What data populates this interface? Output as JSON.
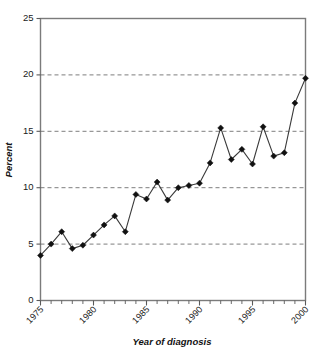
{
  "chart_data": {
    "type": "line",
    "title": "",
    "subtitle": "",
    "xlabel": "Year of diagnosis",
    "ylabel": "Percent",
    "xlim": [
      1975,
      2000
    ],
    "ylim": [
      0,
      25
    ],
    "xticks": [
      1975,
      1980,
      1985,
      1990,
      1995,
      2000
    ],
    "xtick_labels": [
      "1975",
      "1980",
      "1985",
      "1990",
      "1995",
      "2000"
    ],
    "x_minor_tick_interval": 1,
    "yticks": [
      0,
      5,
      10,
      15,
      20,
      25
    ],
    "ytick_labels": [
      "0",
      "5",
      "10",
      "15",
      "20",
      "25"
    ],
    "grid": "horizontal-dashed-at-5-10-15-20",
    "legend": "none",
    "marker": "diamond",
    "line_color": "#3a3a3a",
    "marker_color": "#111111",
    "frame_color": "#7b7b7b",
    "background_color": "#ffffff",
    "x": [
      1975,
      1976,
      1977,
      1978,
      1979,
      1980,
      1981,
      1982,
      1983,
      1984,
      1985,
      1986,
      1987,
      1988,
      1989,
      1990,
      1991,
      1992,
      1993,
      1994,
      1995,
      1996,
      1997,
      1998,
      1999,
      2000
    ],
    "values": [
      4.0,
      5.0,
      6.1,
      4.6,
      4.9,
      5.8,
      6.7,
      7.5,
      6.1,
      9.4,
      9.0,
      10.5,
      8.9,
      10.0,
      10.2,
      10.4,
      12.2,
      15.3,
      12.5,
      13.4,
      12.1,
      15.4,
      12.8,
      13.1,
      17.5,
      19.7
    ],
    "series": [
      {
        "name": "Percent",
        "values": [
          4.0,
          5.0,
          6.1,
          4.6,
          4.9,
          5.8,
          6.7,
          7.5,
          6.1,
          9.4,
          9.0,
          10.5,
          8.9,
          10.0,
          10.2,
          10.4,
          12.2,
          15.3,
          12.5,
          13.4,
          12.1,
          15.4,
          12.8,
          13.1,
          17.5,
          19.7
        ]
      }
    ]
  }
}
